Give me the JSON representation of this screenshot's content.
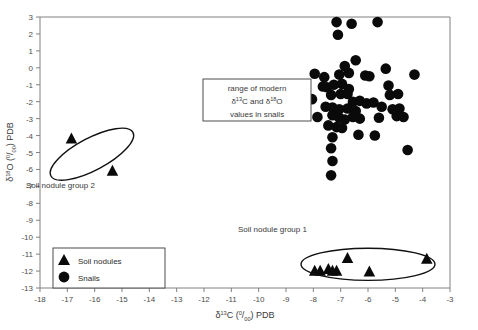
{
  "chart_data": {
    "type": "scatter",
    "title": "",
    "xlabel": "δ13C (0/00) PDB",
    "ylabel": "δ18O (0/00) PDB",
    "xlim": [
      -18,
      -3
    ],
    "ylim": [
      -13,
      3
    ],
    "xticks": [
      -18,
      -17,
      -16,
      -15,
      -14,
      -13,
      -12,
      -11,
      -10,
      -9,
      -8,
      -7,
      -6,
      -5,
      -4,
      -3
    ],
    "yticks": [
      3,
      2,
      1,
      0,
      -1,
      -2,
      -3,
      -4,
      -5,
      -6,
      -7,
      -8,
      -9,
      -10,
      -11,
      -12,
      -13
    ],
    "grid": false,
    "legend_position": "bottom-left",
    "series": [
      {
        "name": "Soil nodules",
        "marker": "triangle",
        "color": "#0a0a0a",
        "points": [
          [
            -16.85,
            -4.15
          ],
          [
            -15.35,
            -6.05
          ],
          [
            -7.95,
            -11.95
          ],
          [
            -7.75,
            -11.95
          ],
          [
            -7.45,
            -11.85
          ],
          [
            -7.3,
            -11.95
          ],
          [
            -7.15,
            -11.95
          ],
          [
            -6.75,
            -11.2
          ],
          [
            -5.95,
            -12.0
          ],
          [
            -3.85,
            -11.25
          ]
        ]
      },
      {
        "name": "Snails",
        "marker": "circle",
        "color": "#0a0a0a",
        "points": [
          [
            -7.15,
            2.7
          ],
          [
            -6.6,
            2.6
          ],
          [
            -5.65,
            2.7
          ],
          [
            -7.1,
            1.95
          ],
          [
            -6.85,
            0.1
          ],
          [
            -6.45,
            0.45
          ],
          [
            -7.95,
            -0.35
          ],
          [
            -7.6,
            -0.55
          ],
          [
            -7.05,
            -0.4
          ],
          [
            -6.7,
            -0.3
          ],
          [
            -6.1,
            -0.45
          ],
          [
            -5.95,
            -0.5
          ],
          [
            -5.35,
            -0.05
          ],
          [
            -4.3,
            -0.4
          ],
          [
            -7.65,
            -1.1
          ],
          [
            -7.5,
            -1.15
          ],
          [
            -7.25,
            -1.0
          ],
          [
            -6.95,
            -0.95
          ],
          [
            -6.7,
            -1.25
          ],
          [
            -5.25,
            -1.05
          ],
          [
            -7.35,
            -1.6
          ],
          [
            -7.0,
            -1.55
          ],
          [
            -6.75,
            -1.55
          ],
          [
            -5.2,
            -1.6
          ],
          [
            -4.9,
            -1.55
          ],
          [
            -8.05,
            -1.85
          ],
          [
            -6.55,
            -2.0
          ],
          [
            -6.3,
            -1.95
          ],
          [
            -6.05,
            -2.1
          ],
          [
            -5.8,
            -2.05
          ],
          [
            -7.55,
            -2.3
          ],
          [
            -7.3,
            -2.35
          ],
          [
            -7.05,
            -2.45
          ],
          [
            -6.75,
            -2.4
          ],
          [
            -6.45,
            -2.55
          ],
          [
            -5.5,
            -2.3
          ],
          [
            -5.1,
            -2.45
          ],
          [
            -4.85,
            -2.4
          ],
          [
            -7.85,
            -2.9
          ],
          [
            -7.3,
            -2.8
          ],
          [
            -7.05,
            -2.95
          ],
          [
            -6.85,
            -3.05
          ],
          [
            -6.55,
            -2.9
          ],
          [
            -6.3,
            -3.0
          ],
          [
            -5.6,
            -2.95
          ],
          [
            -4.95,
            -2.85
          ],
          [
            -4.7,
            -2.9
          ],
          [
            -7.45,
            -3.4
          ],
          [
            -7.15,
            -3.5
          ],
          [
            -6.95,
            -3.55
          ],
          [
            -7.3,
            -4.1
          ],
          [
            -6.35,
            -3.95
          ],
          [
            -5.75,
            -4.0
          ],
          [
            -7.35,
            -4.75
          ],
          [
            -4.55,
            -4.85
          ],
          [
            -7.3,
            -5.5
          ],
          [
            -7.35,
            -6.35
          ]
        ]
      }
    ],
    "annotations": [
      {
        "name": "range-box",
        "lines": [
          "range of modern",
          "δ13C and δ18O",
          "values in snails"
        ],
        "x": -11.6,
        "y": -1.05
      },
      {
        "name": "soil-nodule-group-1-label",
        "text": "Soil nodule group 1",
        "x": -8.35,
        "y": -9.15
      },
      {
        "name": "soil-nodule-group-2-label",
        "text": "Soil nodule group 2",
        "x": -17.35,
        "y": -7.0
      }
    ],
    "ellipses": [
      {
        "name": "soil-nodule-group-1-ellipse",
        "cx": -6.0,
        "cy": -11.6,
        "rx": 2.45,
        "ry": 0.95,
        "rotation": 0
      },
      {
        "name": "soil-nodule-group-2-ellipse",
        "cx": -16.1,
        "cy": -5.1,
        "rx": 1.7,
        "ry": 0.95,
        "rotation": 28
      }
    ]
  },
  "legend": {
    "items": [
      {
        "label": "Soil nodules",
        "marker": "triangle"
      },
      {
        "label": "Snails",
        "marker": "circle"
      }
    ]
  },
  "axes": {
    "x_title_parts": {
      "delta": "δ",
      "sup": "13",
      "element": "C (",
      "permil_top": "0",
      "permil_bot": "00",
      "tail": ") PDB"
    },
    "y_title_parts": {
      "delta": "δ",
      "sup": "18",
      "element": "O (",
      "permil_top": "0",
      "permil_bot": "00",
      "tail": ") PDB"
    }
  }
}
